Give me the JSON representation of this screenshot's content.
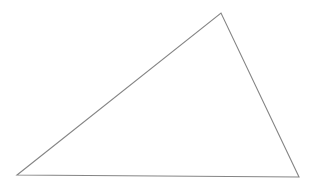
{
  "canvas": {
    "width": 327,
    "height": 193,
    "background_color": "#ffffff",
    "name": "triangle-figure"
  },
  "figure": {
    "type": "triangle",
    "classification": "scalene",
    "stroke_color": "#858585",
    "stroke_width": 1.1,
    "fill_color": "none",
    "vertices": [
      {
        "label": "left-vertex",
        "x": 17,
        "y": 175
      },
      {
        "label": "apex-vertex",
        "x": 221,
        "y": 13
      },
      {
        "label": "right-vertex",
        "x": 299,
        "y": 177
      }
    ],
    "points_attr": "17,175 221,13 299,177",
    "edges": [
      {
        "label": "left-edge",
        "from": "left-vertex",
        "to": "apex-vertex"
      },
      {
        "label": "right-edge",
        "from": "apex-vertex",
        "to": "right-vertex"
      },
      {
        "label": "base-edge",
        "from": "right-vertex",
        "to": "left-vertex"
      }
    ]
  },
  "chart_data": {
    "type": "scatter",
    "title": "",
    "xlabel": "",
    "ylabel": "",
    "grid": false,
    "legend": "none",
    "xlim": [
      0,
      327
    ],
    "ylim": [
      0,
      193
    ],
    "series": [
      {
        "name": "triangle-outline",
        "x": [
          17,
          221,
          299,
          17
        ],
        "y": [
          175,
          13,
          177,
          175
        ]
      }
    ]
  }
}
